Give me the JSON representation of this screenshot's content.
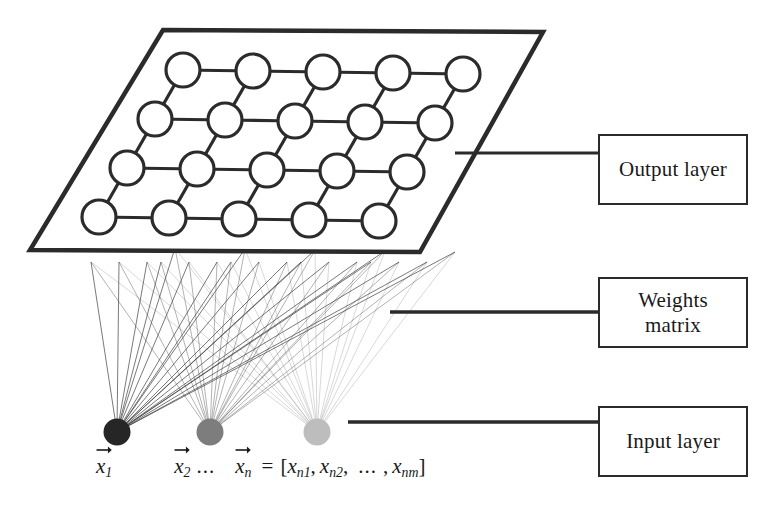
{
  "diagram": {
    "background_color": "#ffffff",
    "stroke_color": "#2b2b2b",
    "callouts": [
      {
        "id": "output-layer",
        "label": "Output layer",
        "leader_line": true
      },
      {
        "id": "weights-matrix",
        "label": "Weights\nmatrix",
        "leader_line": true
      },
      {
        "id": "input-layer",
        "label": "Input layer",
        "leader_line": true
      }
    ],
    "output_layer": {
      "grid_rows": 4,
      "grid_cols": 5,
      "node_count": 20,
      "node_fill": "#ffffff",
      "node_stroke": "#2b2b2b",
      "plane_shape": "parallelogram"
    },
    "input_layer": {
      "node_count": 3,
      "nodes": [
        {
          "label": "x1",
          "color": "#262626"
        },
        {
          "label": "x2",
          "color": "#7d7d7d"
        },
        {
          "label": "xn",
          "color": "#bdbdbd"
        }
      ]
    },
    "weights": {
      "description": "fan of connection lines from each input node to every output node"
    }
  },
  "legend": {
    "vector_1": {
      "symbol": "x",
      "subscript": "1"
    },
    "vector_2": {
      "symbol": "x",
      "subscript": "2"
    },
    "ellipsis": "...",
    "vector_n": {
      "symbol": "x",
      "subscript": "n"
    },
    "equals": "=",
    "open_bracket": "[",
    "close_bracket": "]",
    "components": [
      {
        "symbol": "x",
        "subscript": "n1"
      },
      {
        "symbol": "x",
        "subscript": "n2"
      }
    ],
    "component_ellipsis": "...",
    "component_last": {
      "symbol": "x",
      "subscript": "nm"
    },
    "separator": ","
  }
}
